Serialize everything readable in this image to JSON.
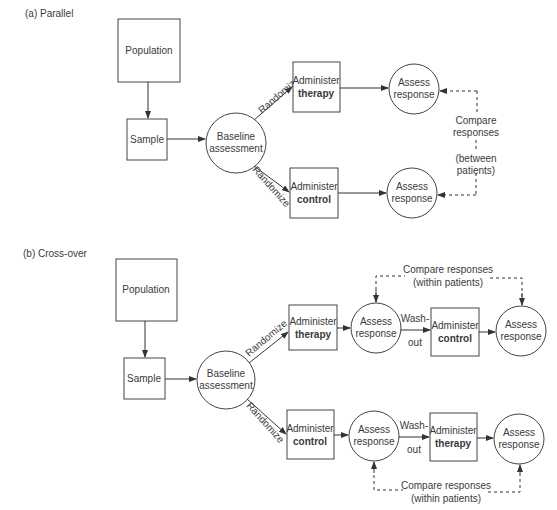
{
  "parallel": {
    "title": "(a) Parallel",
    "population": "Population",
    "sample": "Sample",
    "baseline": [
      "Baseline",
      "assessment"
    ],
    "randomize_top": "Randomize",
    "randomize_bottom": "Randomize",
    "arm_therapy": [
      "Administer",
      "therapy"
    ],
    "arm_control": [
      "Administer",
      "control"
    ],
    "assess_top": [
      "Assess",
      "response"
    ],
    "assess_bottom": [
      "Assess",
      "response"
    ],
    "compare": [
      "Compare",
      "responses",
      "(between",
      "patients)"
    ]
  },
  "crossover": {
    "title": "(b) Cross-over",
    "population": "Population",
    "sample": "Sample",
    "baseline": [
      "Baseline",
      "assessment"
    ],
    "randomize_top": "Randomize",
    "randomize_bottom": "Randomize",
    "top_row": {
      "first_arm": [
        "Administer",
        "therapy"
      ],
      "assess1": [
        "Assess",
        "response"
      ],
      "washout": [
        "Wash-",
        "out"
      ],
      "second_arm": [
        "Administer",
        "control"
      ],
      "assess2": [
        "Assess",
        "response"
      ],
      "compare": [
        "Compare responses",
        "(within patients)"
      ]
    },
    "bottom_row": {
      "first_arm": [
        "Administer",
        "control"
      ],
      "assess1": [
        "Assess",
        "response"
      ],
      "washout": [
        "Wash-",
        "out"
      ],
      "second_arm": [
        "Administer",
        "therapy"
      ],
      "assess2": [
        "Assess",
        "response"
      ],
      "compare": [
        "Compare responses",
        "(within patients)"
      ]
    }
  }
}
